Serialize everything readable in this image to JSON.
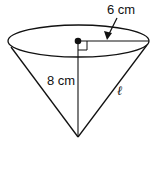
{
  "diagram": {
    "shape": "right circular cone (inverted)",
    "labels": {
      "radius": "6 cm",
      "height": "8 cm",
      "slant_height": "ℓ"
    },
    "colors": {
      "stroke": "#111111",
      "background": "#ffffff"
    }
  }
}
